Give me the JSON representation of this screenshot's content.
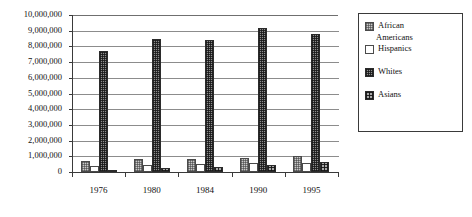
{
  "chart_data": {
    "type": "bar",
    "title": "",
    "xlabel": "",
    "ylabel": "",
    "categories": [
      "1976",
      "1980",
      "1984",
      "1990",
      "1995"
    ],
    "ylim": [
      0,
      10000000
    ],
    "ytick_values": [
      0,
      1000000,
      2000000,
      3000000,
      4000000,
      5000000,
      6000000,
      7000000,
      8000000,
      9000000,
      10000000
    ],
    "ytick_labels": [
      "0",
      "1,000,000",
      "2,000,000",
      "3,000,000",
      "4,000,000",
      "5,000,000",
      "6,000,000",
      "7,000,000",
      "8,000,000",
      "9,000,000",
      "10,000,000"
    ],
    "grid": true,
    "legend_position": "right",
    "series": [
      {
        "name": "African Americans",
        "pattern": "light-dotted",
        "values": [
          700000,
          820000,
          810000,
          900000,
          1050000
        ]
      },
      {
        "name": "Hispanics",
        "pattern": "empty-white",
        "values": [
          380000,
          430000,
          480000,
          550000,
          600000
        ]
      },
      {
        "name": "Whites",
        "pattern": "dark-checkered",
        "values": [
          7700000,
          8450000,
          8400000,
          9200000,
          8800000
        ]
      },
      {
        "name": "Asians",
        "pattern": "dark-grid",
        "values": [
          150000,
          230000,
          320000,
          450000,
          620000
        ]
      }
    ]
  },
  "legend": {
    "items": [
      {
        "label": "African",
        "label2": "Americans"
      },
      {
        "label": "Hispanics"
      },
      {
        "label": "Whites"
      },
      {
        "label": "Asians"
      }
    ]
  }
}
